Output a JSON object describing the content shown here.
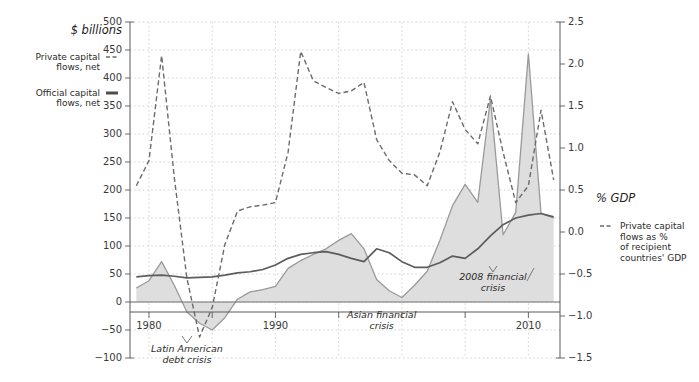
{
  "figure": {
    "left_axis_title": "$ billions",
    "right_axis_title": "% GDP"
  },
  "legend_left": {
    "items": [
      {
        "label_line1": "Private capital",
        "label_line2": "flows, net",
        "marker": "dashed-line-marker",
        "style": "dashed"
      },
      {
        "label_line1": "Official capital",
        "label_line2": "flows, net",
        "marker": "solid-line-marker",
        "style": "solid"
      }
    ]
  },
  "legend_right": {
    "marker": "dashed-line-marker",
    "label_line1": "Private capital",
    "label_line2": "flows as %",
    "label_line3": "of recipient",
    "label_line4": "countries' GDP"
  },
  "annotations": [
    {
      "name": "latin-american-debt-crisis",
      "line1": "Latin American",
      "line2": "debt crisis",
      "x": 1983.0,
      "y_px": 352
    },
    {
      "name": "asian-financial-crisis",
      "line1": "Asian financial",
      "line2": "crisis",
      "x": 1998.4,
      "y_px": 318
    },
    {
      "name": "2008-financial-crisis",
      "line1": "2008 financial",
      "line2": "crisis",
      "x": 2007.2,
      "y_px": 280
    }
  ],
  "chart_data": {
    "type": "area",
    "title": "",
    "xlabel": "",
    "ylabel": "$ billions",
    "y2label": "% GDP",
    "xlim": [
      1978.5,
      2012.5
    ],
    "ylim": [
      -100,
      500
    ],
    "y2lim": [
      -1.5,
      2.5
    ],
    "grid": true,
    "legend_position": "outside-left-and-right",
    "x_ticks": [
      1980,
      1990,
      2010
    ],
    "x_ticks_minor": [
      1985,
      1995,
      2000,
      2005
    ],
    "y_ticks": [
      -100,
      -50,
      0,
      50,
      100,
      150,
      200,
      250,
      300,
      350,
      400,
      450,
      500
    ],
    "y2_ticks": [
      -1.5,
      -1.0,
      -0.5,
      0.0,
      0.5,
      1.0,
      1.5,
      2.0,
      2.5
    ],
    "colors": {
      "private_area_fill": "#dcdcdc",
      "private_area_line": "#9a9a9a",
      "official_line": "#5c5c5c",
      "private_pct_line": "#6b6b6b",
      "grid": "#c9c9c9",
      "axis": "#5a5a5a"
    },
    "x": [
      1979,
      1980,
      1981,
      1982,
      1983,
      1984,
      1985,
      1986,
      1987,
      1988,
      1989,
      1990,
      1991,
      1992,
      1993,
      1994,
      1995,
      1996,
      1997,
      1998,
      1999,
      2000,
      2001,
      2002,
      2003,
      2004,
      2005,
      2006,
      2007,
      2008,
      2009,
      2010,
      2011,
      2012
    ],
    "series": [
      {
        "name": "Private capital flows, net",
        "axis": "left",
        "type": "area",
        "units": "$ billions",
        "values": [
          25,
          38,
          72,
          30,
          -18,
          -38,
          -50,
          -28,
          5,
          18,
          22,
          28,
          60,
          74,
          85,
          95,
          110,
          122,
          95,
          40,
          20,
          8,
          30,
          55,
          110,
          172,
          210,
          178,
          363,
          120,
          160,
          443,
          158,
          150
        ]
      },
      {
        "name": "Official capital flows, net",
        "axis": "left",
        "type": "line",
        "units": "$ billions",
        "values": [
          45,
          47,
          48,
          46,
          43,
          44,
          45,
          48,
          52,
          54,
          58,
          66,
          78,
          85,
          88,
          90,
          85,
          78,
          72,
          95,
          88,
          72,
          62,
          62,
          70,
          82,
          78,
          95,
          118,
          138,
          150,
          155,
          158,
          152
        ]
      },
      {
        "name": "Private capital flows as % of recipient countries' GDP",
        "axis": "right",
        "type": "line",
        "units": "% GDP",
        "values": [
          0.55,
          0.85,
          2.1,
          0.65,
          -0.55,
          -1.25,
          -0.9,
          -0.15,
          0.25,
          0.3,
          0.32,
          0.35,
          0.95,
          2.15,
          1.8,
          1.72,
          1.65,
          1.68,
          1.78,
          1.1,
          0.85,
          0.7,
          0.68,
          0.55,
          0.95,
          1.55,
          1.22,
          1.05,
          1.62,
          0.95,
          0.35,
          0.55,
          1.45,
          0.62
        ]
      }
    ]
  }
}
